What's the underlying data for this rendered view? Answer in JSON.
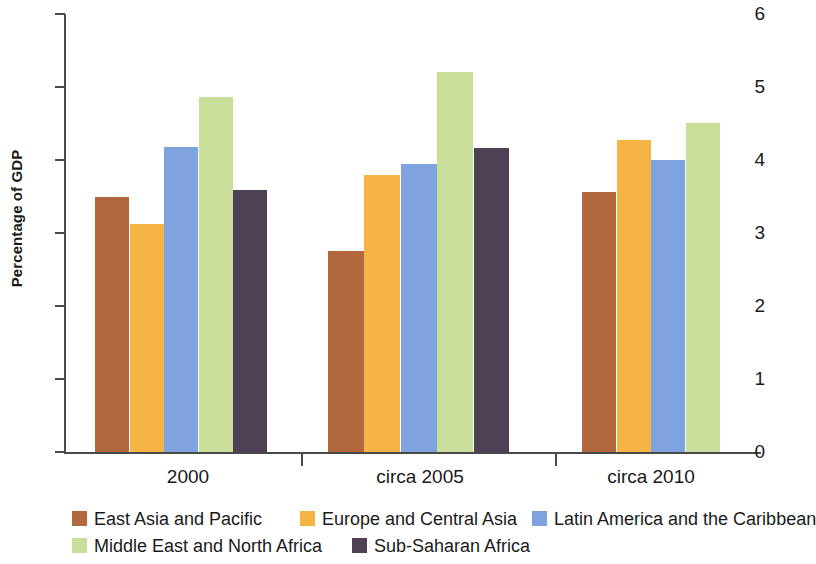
{
  "chart_data": {
    "type": "bar",
    "title": "",
    "subtitle": "",
    "xlabel": "",
    "ylabel": "Percentage of GDP",
    "categories": [
      "2000",
      "circa 2005",
      "circa 2010"
    ],
    "ylim": [
      0,
      6
    ],
    "yticks": [
      0,
      1,
      2,
      3,
      4,
      5,
      6
    ],
    "ytick_labels": [
      "0",
      "1",
      "2",
      "3",
      "4",
      "5",
      "6"
    ],
    "grid": false,
    "legend_position": "bottom-left",
    "series": [
      {
        "name": "East Asia and Pacific",
        "color": "#B2673C",
        "values": [
          3.5,
          2.76,
          3.56
        ]
      },
      {
        "name": "Europe and Central Asia",
        "color": "#F6B445",
        "values": [
          3.12,
          3.79,
          4.27
        ]
      },
      {
        "name": "Latin America and the Caribbean",
        "color": "#7FA3DE",
        "values": [
          4.18,
          3.95,
          4.0
        ]
      },
      {
        "name": "Middle East and North Africa",
        "color": "#C8DE99",
        "values": [
          4.87,
          5.21,
          4.51
        ]
      },
      {
        "name": "Sub-Saharan Africa",
        "color": "#4E4055",
        "values": [
          3.59,
          4.16,
          null
        ]
      }
    ]
  },
  "axis": {
    "y_title": "Percentage of GDP"
  },
  "legend": {
    "rows": [
      [
        "East Asia and Pacific",
        "Europe and Central Asia",
        "Latin America and the Caribbean"
      ],
      [
        "Middle East and North Africa",
        "Sub-Saharan Africa"
      ]
    ]
  }
}
